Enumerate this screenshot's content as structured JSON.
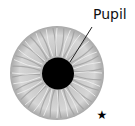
{
  "diagram": {
    "labels": {
      "pupil": "Pupil"
    },
    "marker": "★",
    "colors": {
      "iris_light": "#e2e2e2",
      "iris_dark": "#9a9a9a",
      "pupil": "#000000",
      "line": "#222222",
      "marker": "#000000"
    }
  }
}
